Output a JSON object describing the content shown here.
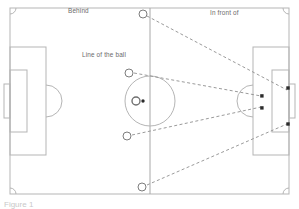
{
  "diagram": {
    "labels": {
      "behind": "Behind",
      "in_front_of": "In front of",
      "line_of_the_ball": "Line of the ball"
    },
    "caption": "Figure 1",
    "colors": {
      "pitch_line": "#b5b5b5",
      "pitch_line_dark": "#9a9a9a",
      "dashed_line": "#8f8f8f",
      "marker_open_stroke": "#7d7d7d",
      "marker_filled": "#2b2b2b",
      "label_text": "#6b6b6b",
      "background": "#ffffff"
    },
    "pitch": {
      "x": 10,
      "y": 8,
      "width": 279,
      "height": 186,
      "halfway_line_x": 150,
      "center_circle": {
        "cx": 150,
        "cy": 101,
        "r": 25
      },
      "center_spot": {
        "cx": 150,
        "cy": 101
      },
      "corner_arc_radius": 6,
      "left_penalty_box": {
        "x": 10,
        "y": 47,
        "width": 36,
        "height": 108
      },
      "left_goal_box": {
        "x": 10,
        "y": 70,
        "width": 17,
        "height": 62
      },
      "left_goal": {
        "x": 4,
        "y": 84,
        "width": 6,
        "height": 34
      },
      "left_arc": {
        "cx": 46,
        "cy": 101,
        "r": 16
      },
      "right_penalty_box": {
        "x": 253,
        "y": 47,
        "width": 36,
        "height": 108
      },
      "right_goal_box": {
        "x": 272,
        "y": 70,
        "width": 17,
        "height": 62
      },
      "right_goal": {
        "x": 289,
        "y": 84,
        "width": 6,
        "height": 34
      },
      "right_arc": {
        "cx": 253,
        "cy": 101,
        "r": 16
      }
    },
    "markers": {
      "open_circles": [
        {
          "name": "attacker-top-halfway",
          "cx": 143,
          "cy": 14,
          "r": 4
        },
        {
          "name": "attacker-upper-left",
          "cx": 129,
          "cy": 73,
          "r": 4
        },
        {
          "name": "attacker-lower-left",
          "cx": 127,
          "cy": 136,
          "r": 4
        },
        {
          "name": "attacker-bottom-halfway",
          "cx": 142,
          "cy": 187,
          "r": 4
        },
        {
          "name": "player-at-ball",
          "cx": 136,
          "cy": 101,
          "r": 4
        }
      ],
      "ball": {
        "name": "ball",
        "cx": 143,
        "cy": 101,
        "r": 1.7
      },
      "filled_markers": [
        {
          "name": "defender-upper-arc",
          "cx": 262,
          "cy": 96
        },
        {
          "name": "defender-lower-arc",
          "cx": 262,
          "cy": 108
        },
        {
          "name": "defender-goalbox-upper",
          "cx": 288,
          "cy": 88
        },
        {
          "name": "defender-goalbox-lower",
          "cx": 288,
          "cy": 124
        }
      ]
    },
    "sight_lines": [
      {
        "name": "sightline-from-top-halfway",
        "x1": 147,
        "y1": 16,
        "x2": 287,
        "y2": 90
      },
      {
        "name": "sightline-from-upper-left",
        "x1": 134,
        "y1": 73,
        "x2": 261,
        "y2": 96
      },
      {
        "name": "sightline-from-lower-left",
        "x1": 132,
        "y1": 135,
        "x2": 261,
        "y2": 107
      },
      {
        "name": "sightline-from-bottom-halfway",
        "x1": 147,
        "y1": 185,
        "x2": 287,
        "y2": 124
      }
    ]
  }
}
